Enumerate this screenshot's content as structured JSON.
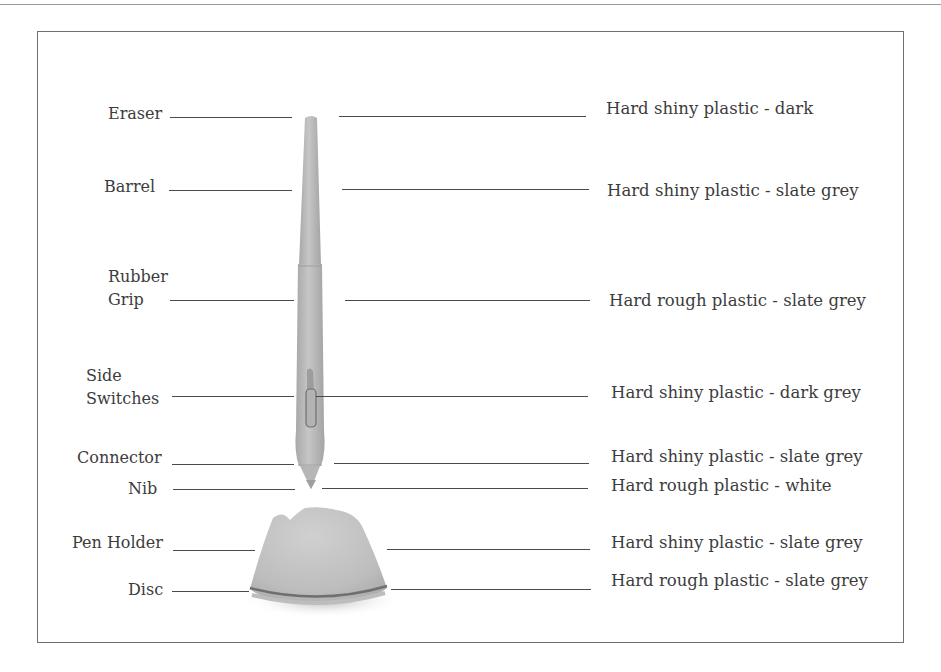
{
  "diagram": {
    "type": "labeled-component-diagram",
    "parts": [
      {
        "id": "eraser",
        "label": "Eraser",
        "material": "Hard shiny plastic - dark"
      },
      {
        "id": "barrel",
        "label": "Barrel",
        "material": "Hard shiny plastic - slate grey"
      },
      {
        "id": "rubber-grip",
        "label_lines": [
          "Rubber",
          "Grip"
        ],
        "material": "Hard rough plastic - slate grey"
      },
      {
        "id": "side-switches",
        "label_lines": [
          "Side",
          "Switches"
        ],
        "material": "Hard shiny plastic - dark grey"
      },
      {
        "id": "connector",
        "label": "Connector",
        "material": "Hard shiny plastic - slate grey"
      },
      {
        "id": "nib",
        "label": "Nib",
        "material": "Hard rough plastic - white"
      },
      {
        "id": "pen-holder",
        "label": "Pen Holder",
        "material": "Hard shiny plastic - slate grey"
      },
      {
        "id": "disc",
        "label": "Disc",
        "material": "Hard rough plastic - slate grey"
      }
    ],
    "colors": {
      "frame": "#6f6f6f",
      "leader_line": "#4a4a4a",
      "text": "#3c3c3c",
      "pen_body": "#b9b9b9",
      "pen_shadow": "#9c9c9c",
      "holder_body": "#c4c4c4",
      "disc_ring": "#7a7a7a"
    }
  }
}
